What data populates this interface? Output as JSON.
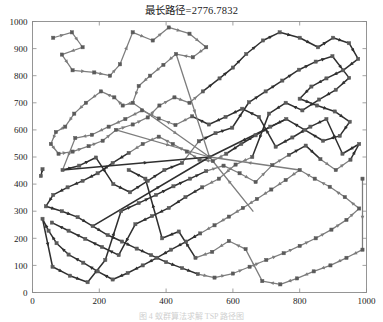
{
  "figure": {
    "title": "最长路径=2776.7832",
    "caption": "图 4 蚁群算法求解 TSP 路径图",
    "background": "#ffffff"
  },
  "chart_data": {
    "type": "scatter",
    "title": "最长路径=2776.7832",
    "xlabel": "",
    "ylabel": "",
    "xlim": [
      0,
      1000
    ],
    "ylim": [
      0,
      1000
    ],
    "xticks": [
      0,
      200,
      400,
      600,
      800,
      1000
    ],
    "yticks": [
      0,
      100,
      200,
      300,
      400,
      500,
      600,
      700,
      800,
      900,
      1000
    ],
    "grid": false,
    "legend": null,
    "route_length": 2776.7832,
    "marker": "node-square",
    "edge_style": "directed-arrow-midpoint",
    "colors": {
      "dark_edge": "#2f2f2f",
      "gray_edge": "#7d7d7d",
      "node": "#5a5a5a",
      "axis": "#8a8a8a",
      "text": "#1a1a1a"
    },
    "nodes": [
      [
        30,
        455
      ],
      [
        25,
        430
      ],
      [
        62,
        940
      ],
      [
        118,
        960
      ],
      [
        150,
        905
      ],
      [
        88,
        878
      ],
      [
        120,
        820
      ],
      [
        185,
        812
      ],
      [
        232,
        800
      ],
      [
        262,
        842
      ],
      [
        300,
        960
      ],
      [
        360,
        930
      ],
      [
        408,
        978
      ],
      [
        470,
        955
      ],
      [
        520,
        905
      ],
      [
        480,
        868
      ],
      [
        430,
        880
      ],
      [
        392,
        840
      ],
      [
        352,
        800
      ],
      [
        318,
        762
      ],
      [
        300,
        700
      ],
      [
        270,
        690
      ],
      [
        245,
        720
      ],
      [
        205,
        742
      ],
      [
        160,
        700
      ],
      [
        125,
        660
      ],
      [
        98,
        612
      ],
      [
        70,
        592
      ],
      [
        55,
        548
      ],
      [
        78,
        512
      ],
      [
        120,
        520
      ],
      [
        168,
        540
      ],
      [
        210,
        560
      ],
      [
        250,
        600
      ],
      [
        300,
        620
      ],
      [
        345,
        646
      ],
      [
        380,
        690
      ],
      [
        425,
        720
      ],
      [
        470,
        700
      ],
      [
        510,
        742
      ],
      [
        560,
        790
      ],
      [
        600,
        830
      ],
      [
        640,
        880
      ],
      [
        690,
        930
      ],
      [
        740,
        960
      ],
      [
        800,
        940
      ],
      [
        855,
        905
      ],
      [
        900,
        940
      ],
      [
        948,
        920
      ],
      [
        975,
        862
      ],
      [
        930,
        820
      ],
      [
        880,
        790
      ],
      [
        835,
        760
      ],
      [
        800,
        715
      ],
      [
        852,
        690
      ],
      [
        905,
        668
      ],
      [
        950,
        630
      ],
      [
        920,
        578
      ],
      [
        870,
        560
      ],
      [
        815,
        600
      ],
      [
        760,
        640
      ],
      [
        712,
        612
      ],
      [
        668,
        580
      ],
      [
        625,
        548
      ],
      [
        580,
        512
      ],
      [
        540,
        485
      ],
      [
        500,
        490
      ],
      [
        462,
        520
      ],
      [
        420,
        548
      ],
      [
        378,
        575
      ],
      [
        330,
        548
      ],
      [
        288,
        515
      ],
      [
        240,
        478
      ],
      [
        195,
        440
      ],
      [
        150,
        412
      ],
      [
        105,
        388
      ],
      [
        62,
        360
      ],
      [
        40,
        318
      ],
      [
        88,
        300
      ],
      [
        135,
        278
      ],
      [
        180,
        245
      ],
      [
        225,
        212
      ],
      [
        268,
        188
      ],
      [
        312,
        162
      ],
      [
        355,
        138
      ],
      [
        400,
        112
      ],
      [
        448,
        90
      ],
      [
        495,
        68
      ],
      [
        545,
        55
      ],
      [
        600,
        70
      ],
      [
        650,
        95
      ],
      [
        700,
        120
      ],
      [
        752,
        145
      ],
      [
        800,
        172
      ],
      [
        848,
        200
      ],
      [
        895,
        232
      ],
      [
        940,
        268
      ],
      [
        978,
        310
      ],
      [
        935,
        352
      ],
      [
        890,
        390
      ],
      [
        845,
        420
      ],
      [
        800,
        452
      ],
      [
        758,
        415
      ],
      [
        715,
        380
      ],
      [
        672,
        345
      ],
      [
        630,
        312
      ],
      [
        588,
        280
      ],
      [
        545,
        248
      ],
      [
        502,
        218
      ],
      [
        460,
        188
      ],
      [
        415,
        158
      ],
      [
        372,
        128
      ],
      [
        330,
        100
      ],
      [
        285,
        72
      ],
      [
        240,
        48
      ],
      [
        195,
        78
      ],
      [
        152,
        110
      ],
      [
        108,
        140
      ],
      [
        72,
        182
      ],
      [
        48,
        228
      ],
      [
        30,
        272
      ],
      [
        60,
        95
      ],
      [
        112,
        62
      ],
      [
        165,
        38
      ],
      [
        218,
        120
      ],
      [
        265,
        300
      ],
      [
        318,
        330
      ],
      [
        370,
        360
      ],
      [
        422,
        392
      ],
      [
        472,
        420
      ],
      [
        520,
        448
      ],
      [
        572,
        468
      ],
      [
        620,
        440
      ],
      [
        668,
        408
      ],
      [
        718,
        470
      ],
      [
        768,
        508
      ],
      [
        818,
        542
      ],
      [
        862,
        492
      ],
      [
        908,
        452
      ],
      [
        952,
        490
      ],
      [
        978,
        548
      ],
      [
        928,
        512
      ],
      [
        880,
        640
      ],
      [
        832,
        612
      ],
      [
        778,
        572
      ],
      [
        728,
        538
      ],
      [
        678,
        648
      ],
      [
        628,
        678
      ],
      [
        578,
        648
      ],
      [
        528,
        620
      ],
      [
        478,
        650
      ],
      [
        428,
        618
      ],
      [
        378,
        642
      ],
      [
        328,
        672
      ],
      [
        278,
        640
      ],
      [
        228,
        612
      ],
      [
        178,
        582
      ],
      [
        128,
        570
      ],
      [
        90,
        452
      ],
      [
        140,
        468
      ],
      [
        190,
        498
      ],
      [
        242,
        400
      ],
      [
        292,
        370
      ],
      [
        345,
        412
      ],
      [
        395,
        452
      ],
      [
        448,
        478
      ],
      [
        498,
        558
      ],
      [
        548,
        588
      ],
      [
        598,
        608
      ],
      [
        648,
        702
      ],
      [
        698,
        742
      ],
      [
        748,
        782
      ],
      [
        798,
        822
      ],
      [
        848,
        852
      ],
      [
        898,
        872
      ],
      [
        948,
        792
      ],
      [
        908,
        748
      ],
      [
        858,
        712
      ],
      [
        808,
        672
      ],
      [
        758,
        700
      ],
      [
        708,
        660
      ],
      [
        658,
        500
      ],
      [
        608,
        472
      ],
      [
        558,
        420
      ],
      [
        508,
        388
      ],
      [
        458,
        352
      ],
      [
        408,
        312
      ],
      [
        358,
        282
      ],
      [
        308,
        252
      ],
      [
        258,
        138
      ],
      [
        208,
        168
      ],
      [
        158,
        198
      ],
      [
        108,
        228
      ],
      [
        58,
        258
      ],
      [
        988,
        420
      ],
      [
        988,
        158
      ],
      [
        940,
        128
      ],
      [
        892,
        100
      ],
      [
        842,
        78
      ],
      [
        792,
        52
      ],
      [
        742,
        30
      ],
      [
        688,
        42
      ],
      [
        638,
        160
      ],
      [
        588,
        190
      ],
      [
        538,
        150
      ],
      [
        488,
        128
      ],
      [
        438,
        225
      ],
      [
        388,
        200
      ],
      [
        338,
        420
      ],
      [
        288,
        452
      ]
    ],
    "edges": [
      {
        "from": 0,
        "to": 1,
        "color": "gray"
      },
      {
        "from": 2,
        "to": 3,
        "color": "gray"
      },
      {
        "from": 3,
        "to": 4,
        "color": "gray"
      },
      {
        "from": 4,
        "to": 5,
        "color": "gray"
      },
      {
        "from": 5,
        "to": 6,
        "color": "gray"
      },
      {
        "from": 6,
        "to": 7,
        "color": "gray"
      },
      {
        "from": 7,
        "to": 8,
        "color": "gray"
      },
      {
        "from": 8,
        "to": 9,
        "color": "gray"
      },
      {
        "from": 10,
        "to": 11,
        "color": "dark"
      },
      {
        "from": 11,
        "to": 12,
        "color": "dark"
      },
      {
        "from": 12,
        "to": 13,
        "color": "dark"
      },
      {
        "from": 13,
        "to": 14,
        "color": "dark"
      },
      {
        "from": 15,
        "to": 16,
        "color": "dark"
      },
      {
        "from": 16,
        "to": 17,
        "color": "dark"
      },
      {
        "from": 18,
        "to": 19,
        "color": "dark"
      },
      {
        "from": 20,
        "to": 21,
        "color": "gray"
      },
      {
        "from": 22,
        "to": 23,
        "color": "gray"
      },
      {
        "from": 24,
        "to": 25,
        "color": "gray"
      },
      {
        "from": 26,
        "to": 27,
        "color": "gray"
      },
      {
        "from": 28,
        "to": 29,
        "color": "gray"
      },
      {
        "from": 30,
        "to": 31,
        "color": "gray"
      },
      {
        "from": 32,
        "to": 33,
        "color": "gray"
      },
      {
        "from": 34,
        "to": 35,
        "color": "gray"
      },
      {
        "from": 36,
        "to": 37,
        "color": "gray"
      },
      {
        "from": 38,
        "to": 39,
        "color": "gray"
      },
      {
        "from": 40,
        "to": 41,
        "color": "dark"
      },
      {
        "from": 42,
        "to": 43,
        "color": "dark"
      },
      {
        "from": 44,
        "to": 45,
        "color": "dark"
      },
      {
        "from": 46,
        "to": 47,
        "color": "dark"
      },
      {
        "from": 48,
        "to": 49,
        "color": "dark"
      },
      {
        "from": 50,
        "to": 51,
        "color": "dark"
      },
      {
        "from": 52,
        "to": 53,
        "color": "dark"
      },
      {
        "from": 54,
        "to": 55,
        "color": "dark"
      },
      {
        "from": 56,
        "to": 57,
        "color": "dark"
      },
      {
        "from": 58,
        "to": 59,
        "color": "gray"
      },
      {
        "from": 60,
        "to": 61,
        "color": "gray"
      },
      {
        "from": 62,
        "to": 63,
        "color": "gray"
      },
      {
        "from": 64,
        "to": 65,
        "color": "dark"
      },
      {
        "from": 66,
        "to": 67,
        "color": "dark"
      },
      {
        "from": 68,
        "to": 69,
        "color": "dark"
      },
      {
        "from": 70,
        "to": 71,
        "color": "dark"
      },
      {
        "from": 72,
        "to": 73,
        "color": "dark"
      },
      {
        "from": 74,
        "to": 75,
        "color": "dark"
      },
      {
        "from": 76,
        "to": 77,
        "color": "dark"
      },
      {
        "from": 78,
        "to": 79,
        "color": "dark"
      },
      {
        "from": 80,
        "to": 81,
        "color": "dark"
      },
      {
        "from": 82,
        "to": 83,
        "color": "dark"
      },
      {
        "from": 84,
        "to": 85,
        "color": "dark"
      },
      {
        "from": 86,
        "to": 87,
        "color": "dark"
      },
      {
        "from": 88,
        "to": 89,
        "color": "dark"
      },
      {
        "from": 90,
        "to": 91,
        "color": "gray"
      },
      {
        "from": 92,
        "to": 93,
        "color": "gray"
      },
      {
        "from": 94,
        "to": 95,
        "color": "gray"
      },
      {
        "from": 96,
        "to": 97,
        "color": "gray"
      },
      {
        "from": 98,
        "to": 99,
        "color": "gray"
      },
      {
        "from": 100,
        "to": 101,
        "color": "gray"
      },
      {
        "from": 102,
        "to": 103,
        "color": "gray"
      },
      {
        "from": 104,
        "to": 105,
        "color": "dark"
      },
      {
        "from": 106,
        "to": 107,
        "color": "dark"
      },
      {
        "from": 108,
        "to": 109,
        "color": "dark"
      },
      {
        "from": 110,
        "to": 111,
        "color": "dark"
      },
      {
        "from": 112,
        "to": 113,
        "color": "dark"
      },
      {
        "from": 114,
        "to": 115,
        "color": "dark"
      },
      {
        "from": 116,
        "to": 117,
        "color": "dark"
      },
      {
        "from": 118,
        "to": 119,
        "color": "gray"
      },
      {
        "from": 120,
        "to": 121,
        "color": "gray"
      },
      {
        "from": 122,
        "to": 123,
        "color": "gray"
      }
    ],
    "hub": {
      "x": 530,
      "y": 500,
      "degree": 8
    }
  }
}
